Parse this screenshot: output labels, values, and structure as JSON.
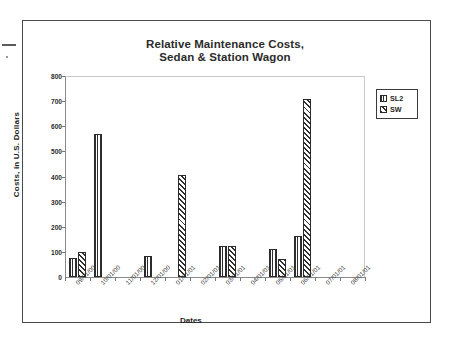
{
  "page": {
    "background": "#ffffff",
    "frame_color": "#4a4a4a"
  },
  "legend": {
    "position": "top-right-outside",
    "entries": [
      {
        "label": "SL2",
        "pattern": "vertical-stripes",
        "color": "#2e2e2e"
      },
      {
        "label": "SW",
        "pattern": "diagonal-hatch",
        "color": "#2e2e2e"
      }
    ]
  },
  "chart_data": {
    "type": "bar",
    "title": "Relative Maintenance Costs, Sedan & Station Wagon",
    "title_line1": "Relative Maintenance Costs,",
    "title_line2": "Sedan & Station Wagon",
    "xlabel": "Dates",
    "ylabel": "Costs, in U.S. Dollars",
    "ylim": [
      0,
      800
    ],
    "yticks": [
      0,
      100,
      200,
      300,
      400,
      500,
      600,
      700,
      800
    ],
    "ytick_labels": [
      "0",
      "100",
      "200",
      "300",
      "400",
      "500",
      "600",
      "700",
      "800"
    ],
    "grid": false,
    "categories": [
      "09/01/00",
      "10/01/00",
      "11/01/00",
      "12/01/00",
      "01/01/01",
      "02/01/01",
      "03/01/01",
      "04/01/01",
      "05/01/01",
      "06/01/01",
      "07/01/01",
      "08/01/01"
    ],
    "series": [
      {
        "name": "SL2",
        "pattern": "vertical-stripes",
        "values": [
          75,
          570,
          0,
          85,
          0,
          0,
          125,
          0,
          110,
          165,
          0,
          0
        ]
      },
      {
        "name": "SW",
        "pattern": "diagonal-hatch",
        "values": [
          100,
          0,
          0,
          0,
          405,
          0,
          125,
          0,
          70,
          710,
          0,
          0
        ]
      }
    ]
  }
}
